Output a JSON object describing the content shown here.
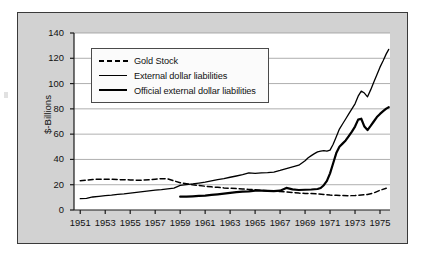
{
  "figure": {
    "background_color": "#ffffff",
    "frame_fill": "#d2d2d2",
    "frame_border_color": "#3a3a3a",
    "plot_fill": "#ffffff",
    "grid_color": "#9a9a9a",
    "line_color": "#000000"
  },
  "axis": {
    "ylabel": "$-Billions",
    "yticks": [
      "0",
      "20",
      "40",
      "60",
      "80",
      "100",
      "120",
      "140"
    ],
    "xticks": [
      "1951",
      "1953",
      "1955",
      "1957",
      "1959",
      "1961",
      "1963",
      "1965",
      "1967",
      "1969",
      "1971",
      "1973",
      "1975"
    ]
  },
  "legend": {
    "items": [
      {
        "label": "Gold Stock",
        "key": "dashed-line-key"
      },
      {
        "label": "External dollar liabilities",
        "key": "thin-solid-line-key"
      },
      {
        "label": "Official external dollar liabilities",
        "key": "thick-solid-line-key"
      }
    ]
  },
  "chart_data": {
    "type": "line",
    "title": "",
    "xlabel": "",
    "ylabel": "$-Billions",
    "xlim": [
      1950.5,
      1975.8
    ],
    "ylim": [
      0,
      140
    ],
    "grid": "horizontal",
    "legend_position": "upper-left-inside",
    "xticks": [
      1951,
      1953,
      1955,
      1957,
      1959,
      1961,
      1963,
      1965,
      1967,
      1969,
      1971,
      1973,
      1975
    ],
    "yticks": [
      0,
      20,
      40,
      60,
      80,
      100,
      120,
      140
    ],
    "series": [
      {
        "name": "Gold Stock",
        "style": "dashed",
        "linewidth": 1.5,
        "x": [
          1951.0,
          1951.5,
          1952.0,
          1952.5,
          1953.0,
          1953.5,
          1954.0,
          1954.5,
          1955.0,
          1955.5,
          1956.0,
          1956.5,
          1957.0,
          1957.5,
          1958.0,
          1958.5,
          1959.0,
          1959.5,
          1960.0,
          1960.5,
          1961.0,
          1961.5,
          1962.0,
          1962.5,
          1963.0,
          1963.5,
          1964.0,
          1964.5,
          1965.0,
          1965.5,
          1966.0,
          1966.5,
          1967.0,
          1967.5,
          1968.0,
          1968.5,
          1969.0,
          1969.5,
          1970.0,
          1970.5,
          1971.0,
          1971.5,
          1972.0,
          1972.5,
          1973.0,
          1973.5,
          1974.0,
          1974.5,
          1975.0,
          1975.5
        ],
        "y": [
          23.2,
          23.6,
          24.2,
          24.4,
          24.4,
          24.3,
          24.1,
          23.9,
          23.8,
          23.6,
          23.6,
          23.9,
          24.3,
          24.8,
          24.6,
          23.1,
          21.5,
          20.8,
          20.0,
          19.4,
          18.8,
          18.3,
          17.9,
          17.5,
          17.2,
          16.9,
          16.6,
          16.3,
          16.0,
          15.6,
          15.3,
          14.9,
          14.6,
          14.3,
          13.9,
          13.4,
          13.1,
          13.0,
          12.7,
          12.3,
          11.8,
          11.6,
          11.5,
          11.3,
          11.5,
          11.9,
          12.2,
          13.5,
          15.6,
          17.2
        ]
      },
      {
        "name": "External dollar liabilities",
        "style": "solid",
        "linewidth": 1.3,
        "x": [
          1951.0,
          1951.5,
          1952.0,
          1952.5,
          1953.0,
          1953.5,
          1954.0,
          1954.5,
          1955.0,
          1955.5,
          1956.0,
          1956.5,
          1957.0,
          1957.5,
          1958.0,
          1958.5,
          1959.0,
          1959.5,
          1960.0,
          1960.5,
          1961.0,
          1961.5,
          1962.0,
          1962.5,
          1963.0,
          1963.5,
          1964.0,
          1964.5,
          1965.0,
          1965.5,
          1966.0,
          1966.5,
          1967.0,
          1967.5,
          1968.0,
          1968.5,
          1969.0,
          1969.25,
          1969.5,
          1969.75,
          1970.0,
          1970.25,
          1970.5,
          1970.75,
          1971.0,
          1971.25,
          1971.5,
          1971.75,
          1972.0,
          1972.25,
          1972.5,
          1972.75,
          1973.0,
          1973.25,
          1973.5,
          1973.75,
          1974.0,
          1974.25,
          1974.5,
          1974.75,
          1975.0,
          1975.25,
          1975.5,
          1975.7
        ],
        "y": [
          9.0,
          9.2,
          10.3,
          10.8,
          11.4,
          11.8,
          12.4,
          12.8,
          13.4,
          14.0,
          14.6,
          15.2,
          15.7,
          16.1,
          16.7,
          17.3,
          19.4,
          20.1,
          20.6,
          21.3,
          22.0,
          23.0,
          24.1,
          24.8,
          25.9,
          26.9,
          28.0,
          29.4,
          29.0,
          29.4,
          29.6,
          30.0,
          31.3,
          32.8,
          34.1,
          35.4,
          38.9,
          41.3,
          43.0,
          44.6,
          46.0,
          46.6,
          47.0,
          46.5,
          47.4,
          52.0,
          58.0,
          64.0,
          68.0,
          72.0,
          76.0,
          80.0,
          84.0,
          90.0,
          94.0,
          92.5,
          89.5,
          95.0,
          101.0,
          107.0,
          113.0,
          118.0,
          123.5,
          127.0
        ]
      },
      {
        "name": "Official external dollar liabilities",
        "style": "solid",
        "linewidth": 2.2,
        "x": [
          1959.0,
          1959.5,
          1960.0,
          1960.5,
          1961.0,
          1961.5,
          1962.0,
          1962.5,
          1963.0,
          1963.5,
          1964.0,
          1964.5,
          1965.0,
          1965.5,
          1966.0,
          1966.5,
          1967.0,
          1967.5,
          1968.0,
          1968.5,
          1969.0,
          1969.5,
          1970.0,
          1970.25,
          1970.5,
          1970.75,
          1971.0,
          1971.25,
          1971.5,
          1971.75,
          1972.0,
          1972.25,
          1972.5,
          1972.75,
          1973.0,
          1973.25,
          1973.5,
          1973.75,
          1974.0,
          1974.25,
          1974.5,
          1974.75,
          1975.0,
          1975.25,
          1975.5,
          1975.7
        ],
        "y": [
          10.5,
          10.6,
          10.8,
          11.1,
          11.4,
          11.9,
          12.4,
          13.0,
          13.6,
          14.2,
          14.6,
          14.8,
          15.3,
          15.4,
          15.2,
          15.0,
          15.3,
          17.5,
          16.3,
          15.8,
          16.0,
          16.2,
          16.6,
          17.4,
          19.6,
          23.0,
          29.0,
          37.0,
          45.0,
          50.0,
          52.5,
          55.0,
          58.5,
          62.0,
          66.0,
          71.5,
          72.2,
          66.0,
          63.2,
          66.5,
          70.0,
          73.5,
          76.0,
          78.2,
          80.2,
          81.3
        ]
      }
    ]
  }
}
